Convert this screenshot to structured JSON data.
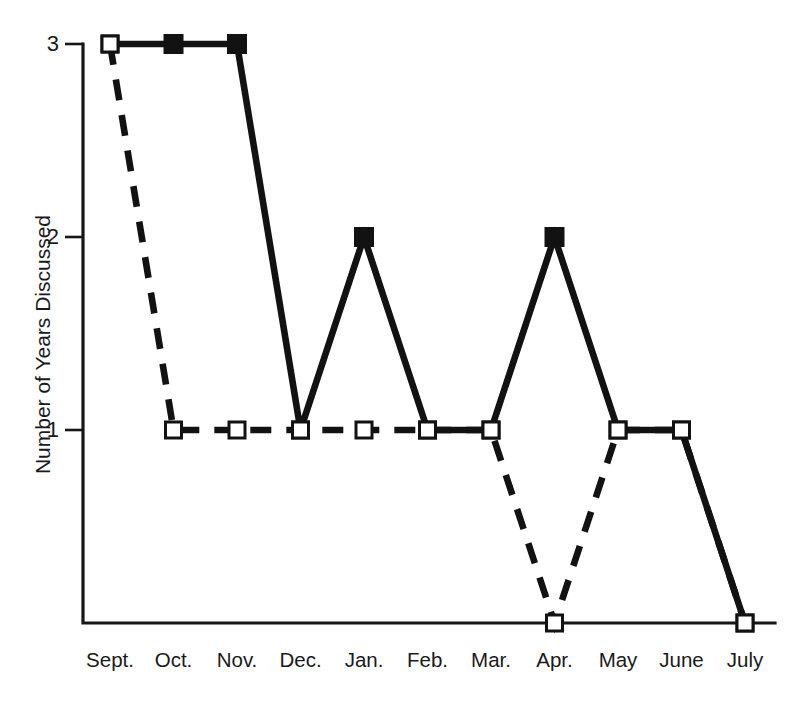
{
  "chart_data": {
    "type": "line",
    "title": "",
    "xlabel": "",
    "ylabel": "Number of Years Discussed",
    "categories": [
      "Sept.",
      "Oct.",
      "Nov.",
      "Dec.",
      "Jan.",
      "Feb.",
      "Mar.",
      "Apr.",
      "May",
      "June",
      "July"
    ],
    "ylim": [
      0,
      3
    ],
    "yticks": [
      1,
      2,
      3
    ],
    "ytick_labels": [
      "1",
      "2",
      "3"
    ],
    "grid": false,
    "legend": "none",
    "series": [
      {
        "name": "solid-series",
        "line_style": "solid",
        "values": [
          3,
          3,
          3,
          1,
          2,
          1,
          1,
          2,
          1,
          1,
          0
        ],
        "marker_styles": [
          "open",
          "filled",
          "filled",
          "open",
          "filled",
          "open",
          "open",
          "filled",
          "open",
          "open",
          "open"
        ]
      },
      {
        "name": "dashed-series",
        "line_style": "dashed",
        "values": [
          3,
          1,
          1,
          1,
          1,
          1,
          1,
          0,
          1,
          1,
          0
        ],
        "marker_styles": [
          "open",
          "open",
          "open",
          "open",
          "open",
          "open",
          "open",
          "open",
          "open",
          "open",
          "open"
        ]
      }
    ]
  },
  "colors": {
    "ink": "#121212",
    "background": "#ffffff",
    "marker_fill_open": "#ffffff",
    "marker_fill_closed": "#121212"
  }
}
